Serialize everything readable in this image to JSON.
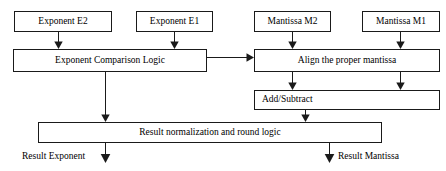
{
  "diagram": {
    "stroke_color": "#1a1a1a",
    "fill_color": "#ffffff",
    "nodes": [
      {
        "id": "exponent_e2",
        "label": "Exponent E2",
        "x": 14,
        "y": 11,
        "w": 98,
        "h": 21,
        "align": "center"
      },
      {
        "id": "exponent_e1",
        "label": "Exponent E1",
        "x": 136,
        "y": 11,
        "w": 77,
        "h": 21,
        "align": "center"
      },
      {
        "id": "mantissa_m2",
        "label": "Mantissa M2",
        "x": 254,
        "y": 11,
        "w": 77,
        "h": 21,
        "align": "center"
      },
      {
        "id": "mantissa_m1",
        "label": "Mantissa M1",
        "x": 362,
        "y": 11,
        "w": 78,
        "h": 21,
        "align": "center"
      },
      {
        "id": "exponent_comparison_logic",
        "label": "Exponent Comparison Logic",
        "x": 13,
        "y": 49,
        "w": 194,
        "h": 23,
        "align": "center"
      },
      {
        "id": "align_mantissa",
        "label": "Align the proper mantissa",
        "x": 254,
        "y": 49,
        "w": 186,
        "h": 23,
        "align": "center"
      },
      {
        "id": "add_subtract",
        "label": "Add/Subtract",
        "x": 254,
        "y": 90,
        "w": 186,
        "h": 20,
        "align": "left"
      },
      {
        "id": "result_normalization",
        "label": "Result normalization and round logic",
        "x": 38,
        "y": 122,
        "w": 344,
        "h": 21,
        "align": "center"
      }
    ],
    "output_labels": [
      {
        "id": "result_exponent",
        "label": "Result Exponent",
        "x": 22,
        "y": 152
      },
      {
        "id": "result_mantissa",
        "label": "Result Mantissa",
        "x": 338,
        "y": 152
      }
    ],
    "edges": [
      {
        "id": "e2-to-compare",
        "from": "exponent_e2",
        "to": "exponent_comparison_logic",
        "type": "vertical-arrow"
      },
      {
        "id": "e1-to-compare",
        "from": "exponent_e1",
        "to": "exponent_comparison_logic",
        "type": "vertical-arrow"
      },
      {
        "id": "m2-to-align",
        "from": "mantissa_m2",
        "to": "align_mantissa",
        "type": "vertical-arrow"
      },
      {
        "id": "m1-to-align",
        "from": "mantissa_m1",
        "to": "align_mantissa",
        "type": "vertical-arrow"
      },
      {
        "id": "compare-to-align",
        "from": "exponent_comparison_logic",
        "to": "align_mantissa",
        "type": "horizontal-arrow"
      },
      {
        "id": "compare-to-normalization",
        "from": "exponent_comparison_logic",
        "to": "result_normalization",
        "type": "vertical-arrow"
      },
      {
        "id": "align-to-addsub-left",
        "from": "align_mantissa",
        "to": "add_subtract",
        "type": "vertical-arrow"
      },
      {
        "id": "align-to-addsub-right",
        "from": "align_mantissa",
        "to": "add_subtract",
        "type": "vertical-arrow"
      },
      {
        "id": "addsub-to-normalization",
        "from": "add_subtract",
        "to": "result_normalization",
        "type": "vertical-arrow"
      },
      {
        "id": "normalization-to-result-exponent",
        "from": "result_normalization",
        "to": "result_exponent",
        "type": "vertical-arrow"
      },
      {
        "id": "normalization-to-result-mantissa",
        "from": "result_normalization",
        "to": "result_mantissa",
        "type": "vertical-arrow"
      }
    ]
  }
}
